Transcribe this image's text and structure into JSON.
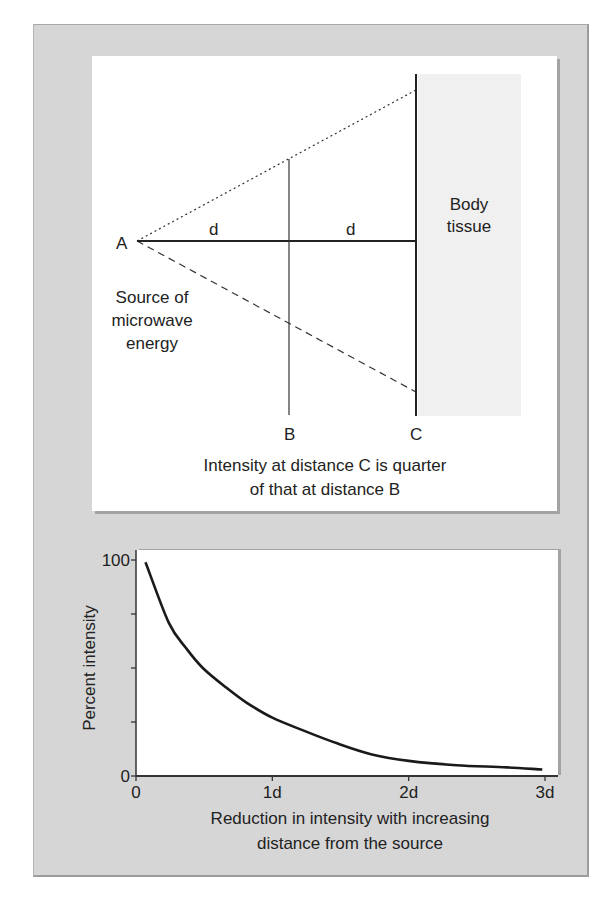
{
  "diagram": {
    "point_labels": {
      "A": "A",
      "B": "B",
      "C": "C"
    },
    "distance_labels": [
      "d",
      "d"
    ],
    "tissue_label": [
      "Body",
      "tissue"
    ],
    "source_label": [
      "Source of",
      "microwave",
      "energy"
    ],
    "caption": [
      "Intensity at distance C is quarter",
      "of that at distance B"
    ],
    "colors": {
      "tissue_fill": "#f0f0f0",
      "panel_bg": "#d6d6d6",
      "line": "#222222"
    }
  },
  "chart_data": {
    "type": "line",
    "title": "",
    "xlabel": "",
    "ylabel": "Percent intensity",
    "caption": [
      "Reduction in intensity with increasing",
      "distance from the source"
    ],
    "xlim": [
      0,
      3
    ],
    "ylim": [
      0,
      100
    ],
    "x_ticks": [
      0,
      1,
      2,
      3
    ],
    "x_tick_labels": [
      "0",
      "1d",
      "2d",
      "3d"
    ],
    "y_ticks": [
      0,
      25,
      50,
      75,
      100
    ],
    "y_tick_labels": [
      "0",
      "",
      "",
      "",
      "100"
    ],
    "grid": false,
    "series": [
      {
        "name": "Percent intensity",
        "x": [
          0.07,
          0.24,
          0.37,
          0.49,
          0.66,
          0.81,
          1.0,
          1.23,
          1.48,
          1.73,
          2.0,
          2.35,
          2.72,
          2.98
        ],
        "y": [
          99,
          71,
          59,
          50,
          41,
          34,
          27,
          21,
          15,
          10,
          7,
          5,
          4,
          3
        ]
      }
    ]
  }
}
